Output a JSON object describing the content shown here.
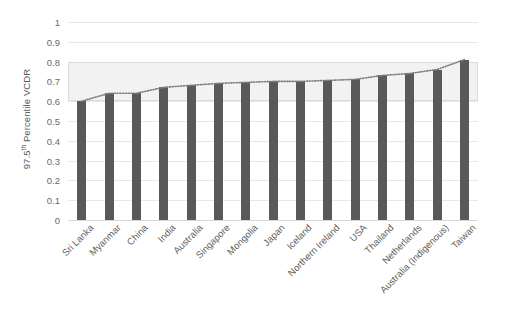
{
  "chart_data": {
    "type": "bar",
    "title": "",
    "subtitle": "",
    "xlabel": "",
    "ylabel": "97.5th Percentile VCDR",
    "ylabel_prefix": "97.5",
    "ylabel_sup": "th",
    "ylabel_suffix": " Percentile VCDR",
    "ylim": [
      0,
      1
    ],
    "ytick_step": 0.1,
    "ytick_labels": [
      "1",
      "0.9",
      "0.8",
      "0.7",
      "0.6",
      "0.5",
      "0.4",
      "0.3",
      "0.2",
      "0.1",
      "0"
    ],
    "ytick_values": [
      1,
      0.9,
      0.8,
      0.7,
      0.6,
      0.5,
      0.4,
      0.3,
      0.2,
      0.1,
      0
    ],
    "grid": true,
    "legend": "none",
    "categories": [
      "Sri Lanka",
      "Myanmar",
      "China",
      "India",
      "Australia",
      "Singapore",
      "Mongolia",
      "Japan",
      "Iceland",
      "Northern Ireland",
      "USA",
      "Thailand",
      "Netherlands",
      "Australia (Indigenous)",
      "Taiwan"
    ],
    "values": [
      0.6,
      0.64,
      0.64,
      0.67,
      0.68,
      0.69,
      0.695,
      0.7,
      0.7,
      0.705,
      0.71,
      0.73,
      0.74,
      0.76,
      0.81
    ],
    "overlay_line": {
      "name": "trend",
      "style": "dotted",
      "color": "#7f7f7f",
      "values": [
        0.6,
        0.64,
        0.64,
        0.67,
        0.68,
        0.69,
        0.695,
        0.7,
        0.7,
        0.705,
        0.71,
        0.73,
        0.74,
        0.76,
        0.81
      ]
    },
    "shaded_band": {
      "label": "",
      "from": 0.6,
      "to": 0.8,
      "color": "#f2f2f2"
    },
    "bar_color": "#595959",
    "grid_color": "#e8e8e8"
  }
}
